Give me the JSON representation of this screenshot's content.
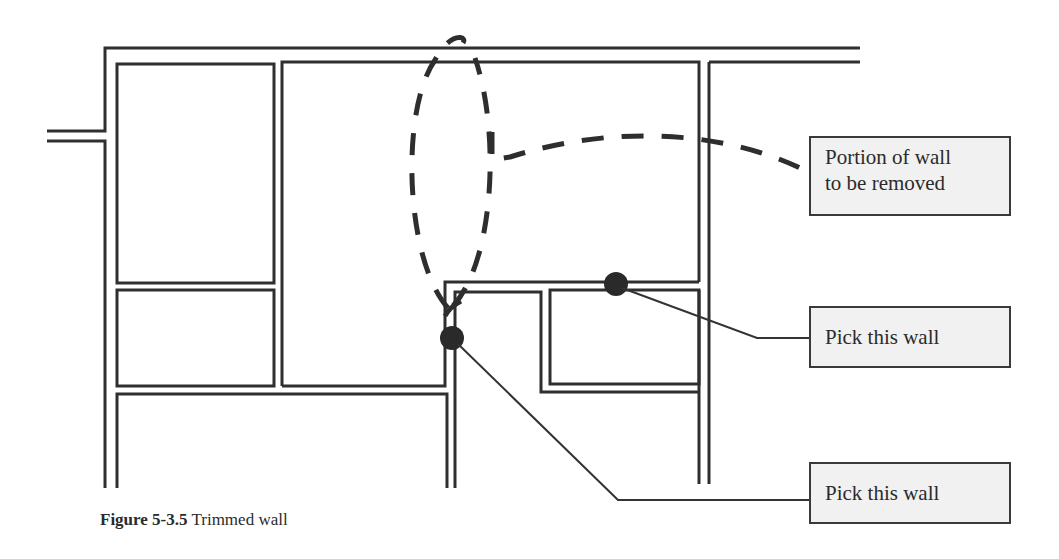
{
  "figure": {
    "caption": {
      "label": "Figure 5-3.5",
      "text": "Trimmed wall"
    },
    "callouts": [
      {
        "id": "remove",
        "text_line1": "Portion of wall",
        "text_line2": "to be removed"
      },
      {
        "id": "pick1",
        "text": "Pick this wall"
      },
      {
        "id": "pick2",
        "text": "Pick this wall"
      }
    ],
    "colors": {
      "line": "#2f2f2f",
      "callout_fill": "#f1f1f1",
      "pick_point": "#2a2a2a"
    }
  }
}
